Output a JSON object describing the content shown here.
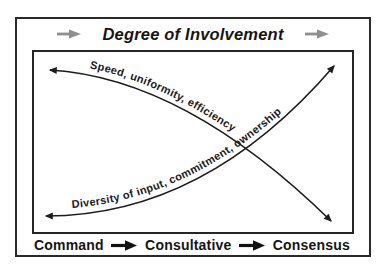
{
  "title": "Degree of Involvement",
  "curves": {
    "speed": {
      "label": "Speed, uniformity, efficiency",
      "trend": "high at Command, decreasing toward Consensus",
      "arrowheads": "both ends"
    },
    "diversity": {
      "label": "Diversity of input, commitment, ownership",
      "trend": "low at Command, increasing toward Consensus",
      "arrowheads": "both ends"
    }
  },
  "x_axis": {
    "labels": [
      "Command",
      "Consultative",
      "Consensus"
    ],
    "separator_icon": "right-arrow"
  },
  "icons": {
    "title_left_arrow": "right-arrow",
    "title_right_arrow": "right-arrow"
  },
  "colors": {
    "background": "#ffffff",
    "border": "#2a2a2a",
    "line": "#1c1c1c",
    "text": "#161616",
    "title_arrow_gray": "#8f8f8f",
    "axis_arrow_black": "#111111"
  }
}
